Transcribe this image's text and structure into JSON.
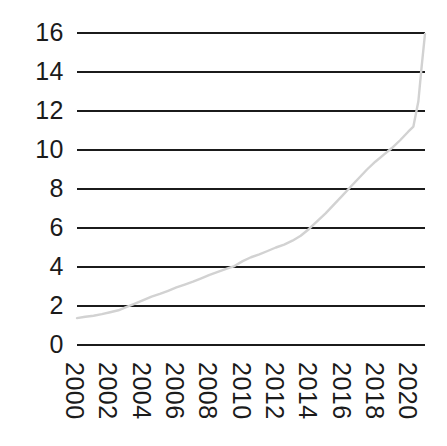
{
  "chart_data": {
    "type": "line",
    "title": "",
    "subtitle": "",
    "xlabel": "",
    "ylabel": "",
    "xlim": [
      2000,
      2021
    ],
    "ylim": [
      0,
      16
    ],
    "grid": true,
    "grid_axis": "y",
    "legend": null,
    "legend_position": "none",
    "line_color": "#d2d2d2",
    "grid_color": "#1b1b1b",
    "background_color": "#ffffff",
    "y_ticks": [
      0,
      2,
      4,
      6,
      8,
      10,
      12,
      14,
      16
    ],
    "y_tick_labels": [
      "0",
      "2",
      "4",
      "6",
      "8",
      "10",
      "12",
      "14",
      "16"
    ],
    "x_ticks": [
      2000,
      2002,
      2004,
      2006,
      2008,
      2010,
      2012,
      2014,
      2016,
      2018,
      2020
    ],
    "x_tick_labels": [
      "2000",
      "2002",
      "2004",
      "2006",
      "2008",
      "2010",
      "2012",
      "2014",
      "2016",
      "2018",
      "2020"
    ],
    "x_tick_rotation": 90,
    "series": [
      {
        "name": "series-1",
        "color": "#d2d2d2",
        "x": [
          2000,
          2000.5,
          2001,
          2001.5,
          2002,
          2002.5,
          2003,
          2003.5,
          2004,
          2004.5,
          2005,
          2005.5,
          2006,
          2006.5,
          2007,
          2007.5,
          2008,
          2008.5,
          2009,
          2009.5,
          2010,
          2010.5,
          2011,
          2011.5,
          2012,
          2012.5,
          2013,
          2013.5,
          2014,
          2014.5,
          2015,
          2015.5,
          2016,
          2016.5,
          2017,
          2017.5,
          2018,
          2018.5,
          2019,
          2019.5,
          2020,
          2020.3,
          2020.6,
          2020.8,
          2021
        ],
        "y": [
          1.38,
          1.45,
          1.5,
          1.58,
          1.68,
          1.78,
          1.95,
          2.12,
          2.3,
          2.48,
          2.62,
          2.78,
          2.95,
          3.1,
          3.25,
          3.42,
          3.6,
          3.75,
          3.9,
          4.05,
          4.3,
          4.5,
          4.65,
          4.82,
          5.0,
          5.15,
          5.35,
          5.6,
          5.95,
          6.35,
          6.75,
          7.2,
          7.65,
          8.1,
          8.55,
          9.0,
          9.4,
          9.75,
          10.1,
          10.5,
          10.95,
          11.2,
          12.5,
          14.3,
          15.95
        ]
      }
    ]
  },
  "axis": {
    "y_labels": [
      "16",
      "14",
      "12",
      "10",
      "8",
      "6",
      "4",
      "2",
      "0"
    ],
    "x_labels": [
      "2000",
      "2002",
      "2004",
      "2006",
      "2008",
      "2010",
      "2012",
      "2014",
      "2016",
      "2018",
      "2020"
    ]
  }
}
